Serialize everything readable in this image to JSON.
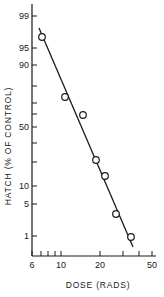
{
  "chart_data": {
    "type": "scatter",
    "title": "",
    "xlabel": "DOSE (RADS)",
    "ylabel": "HATCH (% OF CONTROL)",
    "x_scale": "log",
    "y_scale": "probability",
    "xlim": [
      6,
      50
    ],
    "ylim": [
      0.5,
      99.5
    ],
    "grid": false,
    "legend": null,
    "x_ticks": [
      {
        "value": 6,
        "label": "6",
        "px": 32
      },
      {
        "value": 7,
        "label": "",
        "px": 41
      },
      {
        "value": 8,
        "label": "",
        "px": 48
      },
      {
        "value": 9,
        "label": "",
        "px": 55
      },
      {
        "value": 10,
        "label": "10",
        "px": 61
      },
      {
        "value": 20,
        "label": "20",
        "px": 100
      },
      {
        "value": 30,
        "label": "",
        "px": 123
      },
      {
        "value": 40,
        "label": "",
        "px": 139
      },
      {
        "value": 50,
        "label": "50",
        "px": 152
      }
    ],
    "y_ticks": [
      {
        "value": 99,
        "label": "99",
        "py": 16
      },
      {
        "value": 95,
        "label": "95",
        "py": 48
      },
      {
        "value": 90,
        "label": "90",
        "py": 65
      },
      {
        "value": 80,
        "label": "",
        "py": 86
      },
      {
        "value": 70,
        "label": "",
        "py": 103
      },
      {
        "value": 60,
        "label": "",
        "py": 114
      },
      {
        "value": 50,
        "label": "50",
        "py": 127
      },
      {
        "value": 40,
        "label": "",
        "py": 143
      },
      {
        "value": 30,
        "label": "",
        "py": 162
      },
      {
        "value": 10,
        "label": "10",
        "py": 186
      },
      {
        "value": 5,
        "label": "5",
        "py": 204
      },
      {
        "value": 1,
        "label": "1",
        "py": 236
      }
    ],
    "series": [
      {
        "name": "observed hatch",
        "marker": "open-circle",
        "x": [
          7.2,
          10.7,
          14.8,
          18.6,
          21.8,
          26.5,
          34.5
        ],
        "y": [
          97,
          72,
          60,
          22,
          14,
          3.5,
          1
        ],
        "px": [
          [
            42,
            37
          ],
          [
            65,
            97
          ],
          [
            83,
            115
          ],
          [
            96,
            160
          ],
          [
            105,
            176
          ],
          [
            116,
            214
          ],
          [
            131,
            237
          ]
        ]
      },
      {
        "name": "fitted line",
        "type": "line",
        "endpoints_px": [
          [
            39,
            28
          ],
          [
            133,
            247
          ]
        ]
      }
    ]
  }
}
